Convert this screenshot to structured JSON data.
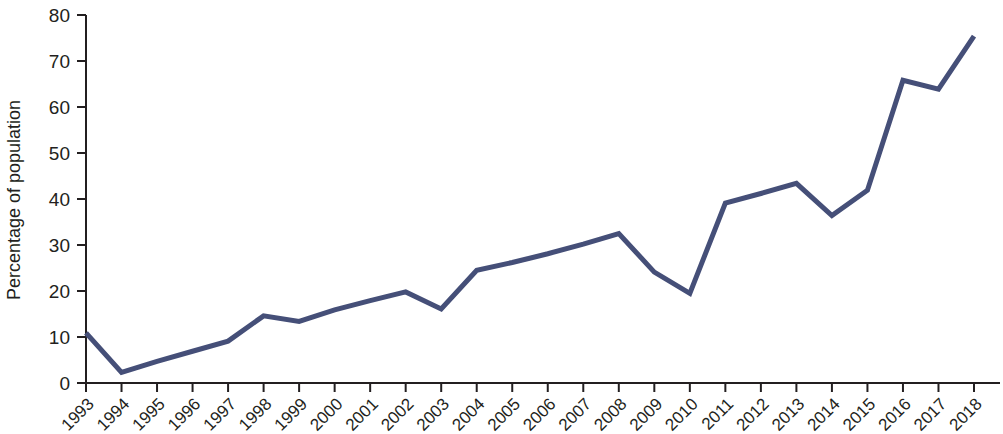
{
  "chart_data": {
    "type": "line",
    "title": "",
    "subtitle": "",
    "xlabel": "",
    "ylabel": "Percentage of population",
    "xlim": [
      1993,
      2018
    ],
    "ylim": [
      0,
      80
    ],
    "ytick_labels": [
      "0",
      "10",
      "20",
      "30",
      "40",
      "50",
      "60",
      "70",
      "80"
    ],
    "ytick_values": [
      0,
      10,
      20,
      30,
      40,
      50,
      60,
      70,
      80
    ],
    "grid": false,
    "legend": false,
    "legend_position": "none",
    "line_color": "#454f78",
    "axis_color": "#231f20",
    "background_color": "#ffffff",
    "categories": [
      "1993",
      "1994",
      "1995",
      "1996",
      "1997",
      "1998",
      "1999",
      "2000",
      "2001",
      "2002",
      "2003",
      "2004",
      "2005",
      "2006",
      "2007",
      "2008",
      "2009",
      "2010",
      "2011",
      "2012",
      "2013",
      "2014",
      "2015",
      "2016",
      "2017",
      "2018"
    ],
    "x": [
      1993,
      1994,
      1995,
      1996,
      1997,
      1998,
      1999,
      2000,
      2001,
      2002,
      2003,
      2004,
      2005,
      2006,
      2007,
      2008,
      2009,
      2010,
      2011,
      2012,
      2013,
      2014,
      2015,
      2016,
      2017,
      2018
    ],
    "values": [
      10.9,
      2.3,
      4.7,
      6.9,
      9.1,
      14.6,
      13.4,
      15.9,
      17.9,
      19.8,
      16.1,
      24.5,
      26.2,
      28.1,
      30.2,
      32.5,
      24.1,
      19.5,
      39.1,
      41.2,
      43.4,
      36.4,
      41.9,
      65.8,
      63.9,
      75.4
    ],
    "series": [
      {
        "name": "Percentage of population",
        "color": "#454f78",
        "values": [
          10.9,
          2.3,
          4.7,
          6.9,
          9.1,
          14.6,
          13.4,
          15.9,
          17.9,
          19.8,
          16.1,
          24.5,
          26.2,
          28.1,
          30.2,
          32.5,
          24.1,
          19.5,
          39.1,
          41.2,
          43.4,
          36.4,
          41.9,
          65.8,
          63.9,
          75.4
        ]
      }
    ]
  }
}
